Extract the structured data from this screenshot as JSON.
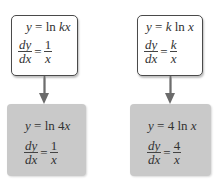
{
  "diagram": {
    "top_left": {
      "equation_lhs": "y",
      "equation_op": "=",
      "equation_fn": "ln",
      "equation_arg": "kx",
      "deriv_num": "dy",
      "deriv_den": "dx",
      "deriv_eq": "=",
      "result_num": "1",
      "result_den": "x"
    },
    "top_right": {
      "equation_lhs": "y",
      "equation_op": "=",
      "equation_coef": "k",
      "equation_fn": "ln",
      "equation_arg": "x",
      "deriv_num": "dy",
      "deriv_den": "dx",
      "deriv_eq": "=",
      "result_num": "k",
      "result_den": "x"
    },
    "bottom_left": {
      "equation_lhs": "y",
      "equation_op": "=",
      "equation_fn": "ln",
      "equation_coef": "4",
      "equation_arg": "x",
      "deriv_num": "dy",
      "deriv_den": "dx",
      "deriv_eq": "=",
      "result_num": "1",
      "result_den": "x"
    },
    "bottom_right": {
      "equation_lhs": "y",
      "equation_op": "=",
      "equation_coef": "4",
      "equation_fn": "ln",
      "equation_arg": "x",
      "deriv_num": "dy",
      "deriv_den": "dx",
      "deriv_eq": "=",
      "result_num": "4",
      "result_den": "x"
    },
    "colors": {
      "top_box_fill": "#ffffff",
      "top_box_border": "#4a4a4a",
      "bottom_box_fill": "#c9c9c9",
      "arrow": "#6b6b6b"
    }
  }
}
